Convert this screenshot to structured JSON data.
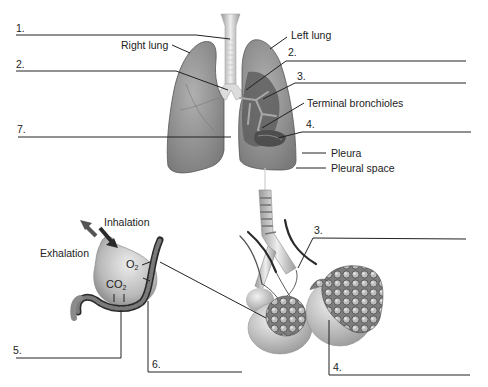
{
  "diagram": {
    "lung_labels": {
      "right_lung": "Right lung",
      "left_lung": "Left lung",
      "terminal_bronchioles": "Terminal bronchioles",
      "pleura": "Pleura",
      "pleural_space": "Pleural space"
    },
    "alveolus_labels": {
      "inhalation": "Inhalation",
      "exhalation": "Exhalation",
      "o2": "O",
      "o2_sub": "2",
      "co2": "CO",
      "co2_sub": "2"
    },
    "blanks": [
      {
        "id": "blank-1",
        "number": "1."
      },
      {
        "id": "blank-2-left",
        "number": "2."
      },
      {
        "id": "blank-2-right",
        "number": "2."
      },
      {
        "id": "blank-3-top",
        "number": "3."
      },
      {
        "id": "blank-4-top",
        "number": "4."
      },
      {
        "id": "blank-7",
        "number": "7."
      },
      {
        "id": "blank-5",
        "number": "5."
      },
      {
        "id": "blank-6",
        "number": "6."
      },
      {
        "id": "blank-3-bottom",
        "number": "3."
      },
      {
        "id": "blank-4-bottom",
        "number": "4."
      }
    ],
    "colors": {
      "line": "#222222",
      "lung_fill": "#8f8f8f",
      "lung_dark": "#5a5a5a",
      "trachea": "#e6e6e6",
      "background": "#ffffff"
    }
  }
}
